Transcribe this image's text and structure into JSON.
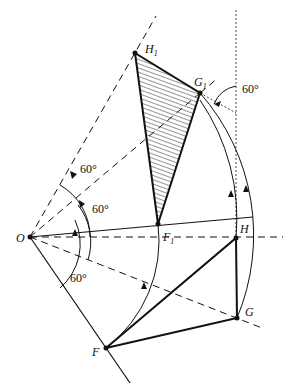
{
  "diagram": {
    "type": "geometric rotation construction",
    "points": {
      "O": {
        "label": "O",
        "x": 30,
        "y": 237
      },
      "F": {
        "label": "F",
        "x": 106,
        "y": 348
      },
      "G": {
        "label": "G",
        "x": 237,
        "y": 318
      },
      "H": {
        "label": "H",
        "x": 236,
        "y": 238
      },
      "F1": {
        "label": "F",
        "sub": "1",
        "x": 158,
        "y": 224
      },
      "G1": {
        "label": "G",
        "sub": "1",
        "x": 200,
        "y": 93
      },
      "H1": {
        "label": "H",
        "sub": "1",
        "x": 135,
        "y": 53
      }
    },
    "angles": [
      {
        "label": "60°",
        "position": "upper-left ray"
      },
      {
        "label": "60°",
        "position": "middle ray"
      },
      {
        "label": "60°",
        "position": "lower ray"
      },
      {
        "label": "60°",
        "position": "at G1 vertical"
      }
    ],
    "triangles": [
      {
        "name": "FGH",
        "vertices": [
          "F",
          "G",
          "H"
        ],
        "hatched": false
      },
      {
        "name": "F1G1H1",
        "vertices": [
          "F1",
          "G1",
          "H1"
        ],
        "hatched": true
      }
    ]
  }
}
